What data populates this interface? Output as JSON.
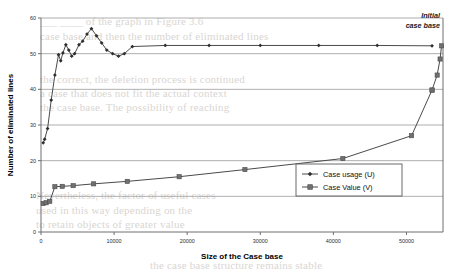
{
  "figure": {
    "background_color": "#ffffff",
    "line_color": "#4a4a4a",
    "grid_color": "#9a9a9a",
    "axis_color": "#6e6e6e"
  },
  "annotations": [
    {
      "name": "initial-case-base",
      "line1": "Initial",
      "line2": "case base"
    }
  ],
  "legend": {
    "position": "center-right",
    "entries": [
      {
        "label": "Case usage (U)",
        "marker": "diamond"
      },
      {
        "label": "Case Value (V)",
        "marker": "square"
      }
    ]
  },
  "bleed_text": [
    {
      "x": 40,
      "y": 14,
      "text": "___ ____ of the graph in Figure 3.6"
    },
    {
      "x": 40,
      "y": 29,
      "text": "case base and then the number of eliminated lines"
    },
    {
      "x": 40,
      "y": 72,
      "text": "the correct, the deletion process is continued"
    },
    {
      "x": 40,
      "y": 86,
      "text": "a case that does not fit the actual context"
    },
    {
      "x": 40,
      "y": 100,
      "text": "the case base. The possibility of reaching"
    },
    {
      "x": 36,
      "y": 188,
      "text": "Nevertheless, the factor of useful cases"
    },
    {
      "x": 36,
      "y": 203,
      "text": "used in this way depending on the"
    },
    {
      "x": 36,
      "y": 217,
      "text": "to retain objects of greater value"
    },
    {
      "x": 150,
      "y": 258,
      "text": "the case base structure remains stable"
    }
  ],
  "chart_data": {
    "type": "line",
    "title": "",
    "xlabel": "Size of the Case base",
    "ylabel": "Number of eliminated lines",
    "xlim": [
      0,
      55000
    ],
    "ylim": [
      0,
      60
    ],
    "xticks": [
      0,
      10000,
      20000,
      30000,
      40000,
      50000
    ],
    "xtick_labels": [
      "0",
      "10000",
      "20000",
      "30000",
      "40000",
      "50000"
    ],
    "yticks": [
      0,
      10,
      20,
      30,
      40,
      50,
      60
    ],
    "ytick_labels": [
      "0",
      "10",
      "20",
      "30",
      "40",
      "50",
      "60"
    ],
    "grid": "horizontal",
    "legend_position": "center-right",
    "series": [
      {
        "name": "Case usage (U)",
        "marker": "diamond",
        "x": [
          300,
          500,
          900,
          1400,
          1900,
          2400,
          2700,
          3000,
          3400,
          3800,
          4200,
          4600,
          5200,
          5700,
          6300,
          6900,
          7600,
          8300,
          9000,
          9800,
          10600,
          11400,
          12500,
          17000,
          23000,
          30000,
          38000,
          46000,
          53500
        ],
        "y": [
          25.0,
          26.0,
          29.0,
          37.0,
          44.0,
          49.7,
          48.0,
          50.2,
          52.5,
          51.0,
          49.3,
          50.0,
          52.5,
          53.5,
          55.5,
          57.0,
          55.0,
          53.0,
          51.0,
          50.0,
          49.3,
          50.0,
          52.0,
          52.3,
          52.3,
          52.3,
          52.3,
          52.3,
          52.2
        ]
      },
      {
        "name": "Case Value (V)",
        "marker": "square",
        "x": [
          300,
          700,
          1200,
          1900,
          2900,
          4400,
          7200,
          11800,
          18900,
          27900,
          41300,
          50700,
          53500
        ],
        "y": [
          8.0,
          8.2,
          8.6,
          12.7,
          12.8,
          13.0,
          13.5,
          14.2,
          15.5,
          17.5,
          20.6,
          27.0,
          39.8
        ]
      },
      {
        "name": "Case Value (V) tail",
        "marker": "square",
        "x": [
          53500,
          54200,
          54600,
          54800
        ],
        "y": [
          39.8,
          44.0,
          48.5,
          52.2
        ]
      }
    ]
  }
}
